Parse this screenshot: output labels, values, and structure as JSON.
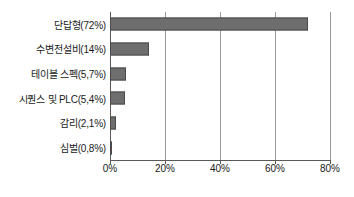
{
  "chart_data": {
    "type": "bar",
    "orientation": "horizontal",
    "title": "",
    "xlabel": "",
    "ylabel": "",
    "categories": [
      "단답형(72%)",
      "수변전설비(14%)",
      "테이블 스펙(5,7%)",
      "시퀀스 및 PLC(5,4%)",
      "감리(2,1%)",
      "심벌(0,8%)"
    ],
    "values": [
      72,
      14,
      5.7,
      5.4,
      2.1,
      0.8
    ],
    "xlim": [
      0,
      80
    ],
    "xticks": [
      0,
      20,
      40,
      60,
      80
    ],
    "xticklabels": [
      "0%",
      "20%",
      "40%",
      "60%",
      "80%"
    ],
    "grid": "vertical",
    "legend": "none",
    "bar_color": "#6e6e6e",
    "bar_edge_color": "#4a4a4a",
    "axis_color": "#595959",
    "gridline_color": "#9a9a9a",
    "text_color": "#1a1a1a",
    "background": "#ffffff"
  }
}
